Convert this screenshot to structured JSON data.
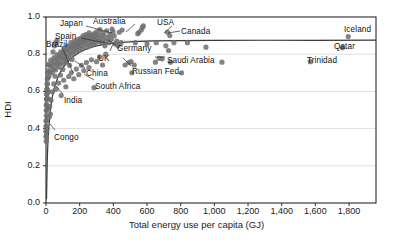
{
  "chart_data": {
    "type": "scatter",
    "title": "",
    "xlabel": "Total energy use per capita (GJ)",
    "ylabel": "HDI",
    "xlim": [
      0,
      1960
    ],
    "ylim": [
      0.0,
      1.0
    ],
    "grid": "horizontal",
    "legend": "none",
    "xticks": [
      0,
      200,
      400,
      600,
      800,
      1000,
      1200,
      1400,
      1600,
      1800
    ],
    "xticklabels": [
      "0",
      "200",
      "400",
      "600",
      "800",
      "1,000",
      "1,200",
      "1,400",
      "1,600",
      "1,800"
    ],
    "yticks": [
      0.0,
      0.2,
      0.4,
      0.6,
      0.8,
      1.0
    ],
    "yticklabels": [
      "0.0",
      "0.2",
      "0.4",
      "0.6",
      "0.8",
      "1.0"
    ],
    "marker": {
      "shape": "circle",
      "color": "#6e6e6e",
      "radius": 2.6,
      "opacity": 0.85
    },
    "trend": {
      "kind": "saturating-curve",
      "color": "#3a3a3a",
      "asymptote_hdi": 0.875,
      "points": [
        [
          3,
          0.02
        ],
        [
          5,
          0.12
        ],
        [
          8,
          0.25
        ],
        [
          12,
          0.34
        ],
        [
          18,
          0.42
        ],
        [
          25,
          0.49
        ],
        [
          35,
          0.56
        ],
        [
          50,
          0.62
        ],
        [
          70,
          0.675
        ],
        [
          95,
          0.72
        ],
        [
          125,
          0.757
        ],
        [
          160,
          0.787
        ],
        [
          200,
          0.811
        ],
        [
          250,
          0.832
        ],
        [
          300,
          0.845
        ],
        [
          360,
          0.855
        ],
        [
          430,
          0.862
        ],
        [
          520,
          0.867
        ],
        [
          640,
          0.871
        ],
        [
          800,
          0.873
        ],
        [
          1000,
          0.874
        ],
        [
          1300,
          0.875
        ],
        [
          1600,
          0.875
        ],
        [
          1960,
          0.876
        ]
      ]
    },
    "annotations": [
      {
        "label": "Japan",
        "lx": 60,
        "ly": 19,
        "anchor": "start",
        "leader": [
          [
            86,
            26
          ],
          [
            112,
            33
          ]
        ]
      },
      {
        "label": "Australia",
        "lx": 93,
        "ly": 17,
        "anchor": "start",
        "leader": [
          [
            135,
            24
          ],
          [
            126,
            32
          ]
        ]
      },
      {
        "label": "USA",
        "lx": 157,
        "ly": 18,
        "anchor": "start",
        "leader": [
          [
            172,
            26
          ],
          [
            164,
            33
          ]
        ]
      },
      {
        "label": "Canada",
        "lx": 181,
        "ly": 27,
        "anchor": "start",
        "leader": [
          [
            180,
            31
          ],
          [
            168,
            33
          ]
        ]
      },
      {
        "label": "Iceland",
        "lx": 344,
        "ly": 25,
        "anchor": "start",
        "leader": []
      },
      {
        "label": "Spain",
        "lx": 55,
        "ly": 32,
        "anchor": "start",
        "leader": [
          [
            81,
            38
          ],
          [
            106,
            43
          ]
        ]
      },
      {
        "label": "Brazil",
        "lx": 46,
        "ly": 40,
        "anchor": "start",
        "leader": [
          [
            62,
            47
          ],
          [
            73,
            73
          ]
        ]
      },
      {
        "label": "Germany",
        "lx": 117,
        "ly": 44,
        "anchor": "start",
        "leader": [
          [
            116,
            45
          ],
          [
            108,
            40
          ]
        ]
      },
      {
        "label": "Qatar",
        "lx": 334,
        "ly": 42,
        "anchor": "start",
        "leader": []
      },
      {
        "label": "UK",
        "lx": 98,
        "ly": 54,
        "anchor": "start",
        "leader": [
          [
            110,
            51
          ],
          [
            113,
            44
          ]
        ]
      },
      {
        "label": "Saudi Arabia",
        "lx": 167,
        "ly": 56,
        "anchor": "start",
        "leader": [
          [
            165,
            57
          ],
          [
            155,
            57
          ]
        ]
      },
      {
        "label": "Trinidad",
        "lx": 307,
        "ly": 56,
        "anchor": "start",
        "leader": []
      },
      {
        "label": "China",
        "lx": 86,
        "ly": 69,
        "anchor": "start",
        "leader": [
          [
            85,
            68
          ],
          [
            75,
            61
          ]
        ]
      },
      {
        "label": "Russian Fed.",
        "lx": 132,
        "ly": 67,
        "anchor": "start",
        "leader": [
          [
            131,
            66
          ],
          [
            123,
            58
          ]
        ]
      },
      {
        "label": "South Africa",
        "lx": 95,
        "ly": 82,
        "anchor": "start",
        "leader": [
          [
            94,
            80
          ],
          [
            84,
            74
          ]
        ]
      },
      {
        "label": "India",
        "lx": 64,
        "ly": 96,
        "anchor": "start",
        "leader": [
          [
            63,
            94
          ],
          [
            56,
            86
          ]
        ]
      },
      {
        "label": "Congo",
        "lx": 54,
        "ly": 133,
        "anchor": "start",
        "leader": [
          [
            55,
            130
          ],
          [
            50,
            124
          ]
        ]
      }
    ],
    "points": [
      [
        1795,
        0.895
      ],
      [
        1760,
        0.835
      ],
      [
        1570,
        0.76
      ],
      [
        1045,
        0.757
      ],
      [
        950,
        0.838
      ],
      [
        840,
        0.862
      ],
      [
        805,
        0.7
      ],
      [
        760,
        0.862
      ],
      [
        740,
        0.757
      ],
      [
        735,
        0.9
      ],
      [
        728,
        0.82
      ],
      [
        722,
        0.918
      ],
      [
        712,
        0.845
      ],
      [
        690,
        0.775
      ],
      [
        672,
        0.778
      ],
      [
        655,
        0.862
      ],
      [
        650,
        0.757
      ],
      [
        600,
        0.855
      ],
      [
        578,
        0.952
      ],
      [
        572,
        0.944
      ],
      [
        566,
        0.93
      ],
      [
        552,
        0.918
      ],
      [
        545,
        0.91
      ],
      [
        530,
        0.862
      ],
      [
        524,
        0.742
      ],
      [
        510,
        0.7
      ],
      [
        505,
        0.76
      ],
      [
        492,
        0.755
      ],
      [
        470,
        0.742
      ],
      [
        452,
        0.93
      ],
      [
        446,
        0.862
      ],
      [
        435,
        0.918
      ],
      [
        428,
        0.845
      ],
      [
        420,
        0.87
      ],
      [
        412,
        0.855
      ],
      [
        405,
        0.898
      ],
      [
        398,
        0.922
      ],
      [
        392,
        0.935
      ],
      [
        388,
        0.88
      ],
      [
        380,
        0.905
      ],
      [
        374,
        0.862
      ],
      [
        368,
        0.89
      ],
      [
        360,
        0.925
      ],
      [
        355,
        0.87
      ],
      [
        350,
        0.845
      ],
      [
        345,
        0.9
      ],
      [
        340,
        0.88
      ],
      [
        335,
        0.915
      ],
      [
        330,
        0.862
      ],
      [
        326,
        0.892
      ],
      [
        320,
        0.932
      ],
      [
        315,
        0.87
      ],
      [
        310,
        0.905
      ],
      [
        305,
        0.885
      ],
      [
        300,
        0.92
      ],
      [
        296,
        0.86
      ],
      [
        292,
        0.898
      ],
      [
        288,
        0.876
      ],
      [
        284,
        0.91
      ],
      [
        280,
        0.855
      ],
      [
        276,
        0.89
      ],
      [
        272,
        0.868
      ],
      [
        268,
        0.902
      ],
      [
        264,
        0.845
      ],
      [
        260,
        0.882
      ],
      [
        256,
        0.915
      ],
      [
        252,
        0.862
      ],
      [
        248,
        0.895
      ],
      [
        244,
        0.838
      ],
      [
        240,
        0.875
      ],
      [
        236,
        0.905
      ],
      [
        232,
        0.852
      ],
      [
        228,
        0.888
      ],
      [
        224,
        0.866
      ],
      [
        220,
        0.898
      ],
      [
        216,
        0.832
      ],
      [
        212,
        0.87
      ],
      [
        208,
        0.845
      ],
      [
        204,
        0.885
      ],
      [
        200,
        0.86
      ],
      [
        196,
        0.822
      ],
      [
        192,
        0.85
      ],
      [
        188,
        0.878
      ],
      [
        184,
        0.835
      ],
      [
        180,
        0.862
      ],
      [
        176,
        0.812
      ],
      [
        172,
        0.845
      ],
      [
        168,
        0.87
      ],
      [
        164,
        0.825
      ],
      [
        160,
        0.852
      ],
      [
        156,
        0.8
      ],
      [
        152,
        0.835
      ],
      [
        148,
        0.862
      ],
      [
        144,
        0.808
      ],
      [
        140,
        0.84
      ],
      [
        136,
        0.782
      ],
      [
        132,
        0.818
      ],
      [
        128,
        0.845
      ],
      [
        124,
        0.79
      ],
      [
        120,
        0.822
      ],
      [
        116,
        0.765
      ],
      [
        112,
        0.8
      ],
      [
        108,
        0.83
      ],
      [
        104,
        0.775
      ],
      [
        100,
        0.808
      ],
      [
        96,
        0.748
      ],
      [
        92,
        0.782
      ],
      [
        88,
        0.812
      ],
      [
        84,
        0.755
      ],
      [
        80,
        0.79
      ],
      [
        76,
        0.73
      ],
      [
        72,
        0.765
      ],
      [
        68,
        0.798
      ],
      [
        64,
        0.742
      ],
      [
        60,
        0.775
      ],
      [
        56,
        0.715
      ],
      [
        52,
        0.75
      ],
      [
        48,
        0.782
      ],
      [
        44,
        0.722
      ],
      [
        40,
        0.758
      ],
      [
        36,
        0.7
      ],
      [
        32,
        0.735
      ],
      [
        28,
        0.768
      ],
      [
        24,
        0.705
      ],
      [
        20,
        0.74
      ],
      [
        17,
        0.68
      ],
      [
        15,
        0.712
      ],
      [
        13,
        0.745
      ],
      [
        11,
        0.672
      ],
      [
        10,
        0.7
      ],
      [
        9,
        0.64
      ],
      [
        8,
        0.668
      ],
      [
        7,
        0.612
      ],
      [
        6,
        0.64
      ],
      [
        5,
        0.585
      ],
      [
        5,
        0.612
      ],
      [
        4,
        0.558
      ],
      [
        4,
        0.585
      ],
      [
        3,
        0.53
      ],
      [
        3,
        0.558
      ],
      [
        3,
        0.498
      ],
      [
        2,
        0.525
      ],
      [
        2,
        0.47
      ],
      [
        2,
        0.498
      ],
      [
        2,
        0.445
      ],
      [
        2,
        0.412
      ],
      [
        1,
        0.44
      ],
      [
        1,
        0.385
      ],
      [
        1,
        0.412
      ],
      [
        1,
        0.358
      ],
      [
        1,
        0.385
      ],
      [
        1,
        0.332
      ],
      [
        1,
        0.358
      ],
      [
        60,
        0.612
      ],
      [
        75,
        0.645
      ],
      [
        90,
        0.578
      ],
      [
        105,
        0.66
      ],
      [
        118,
        0.625
      ],
      [
        135,
        0.68
      ],
      [
        150,
        0.7
      ],
      [
        165,
        0.668
      ],
      [
        180,
        0.72
      ],
      [
        195,
        0.69
      ],
      [
        210,
        0.74
      ],
      [
        225,
        0.712
      ],
      [
        240,
        0.755
      ],
      [
        255,
        0.728
      ],
      [
        270,
        0.77
      ],
      [
        285,
        0.62
      ],
      [
        300,
        0.76
      ],
      [
        318,
        0.785
      ],
      [
        336,
        0.742
      ],
      [
        355,
        0.8
      ],
      [
        30,
        0.552
      ],
      [
        38,
        0.598
      ],
      [
        46,
        0.64
      ],
      [
        54,
        0.682
      ],
      [
        26,
        0.478
      ],
      [
        22,
        0.52
      ],
      [
        19,
        0.462
      ],
      [
        16,
        0.56
      ],
      [
        14,
        0.598
      ],
      [
        12,
        0.51
      ],
      [
        42,
        0.812
      ],
      [
        50,
        0.845
      ],
      [
        58,
        0.862
      ],
      [
        66,
        0.875
      ],
      [
        140,
        0.74
      ],
      [
        155,
        0.772
      ],
      [
        118,
        0.755
      ],
      [
        100,
        0.718
      ],
      [
        86,
        0.688
      ]
    ]
  }
}
